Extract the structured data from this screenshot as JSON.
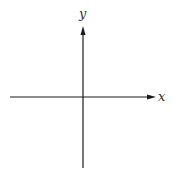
{
  "diagram": {
    "type": "cartesian-axes",
    "x_axis_label": "x",
    "y_axis_label": "y",
    "line_color": "#1a1a1a",
    "background": "#ffffff"
  }
}
